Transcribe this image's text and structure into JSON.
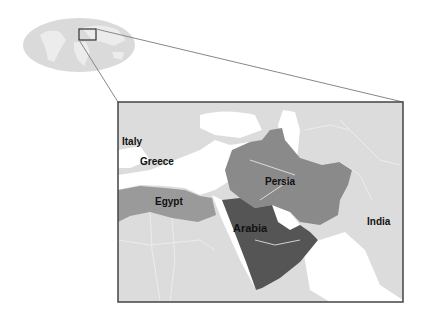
{
  "map": {
    "title": "Ancient Middle East locator map",
    "labels": {
      "italy": "Italy",
      "greece": "Greece",
      "egypt": "Egypt",
      "persia": "Persia",
      "arabia": "Arabia",
      "india": "India"
    },
    "colors": {
      "land": "#dcdcdc",
      "water": "#ffffff",
      "persia": "#8a8a8a",
      "egypt": "#9a9a9a",
      "arabia": "#555555",
      "borders": "#f2f2f2",
      "frame": "#444444",
      "globe": "#d6d6d6"
    }
  }
}
